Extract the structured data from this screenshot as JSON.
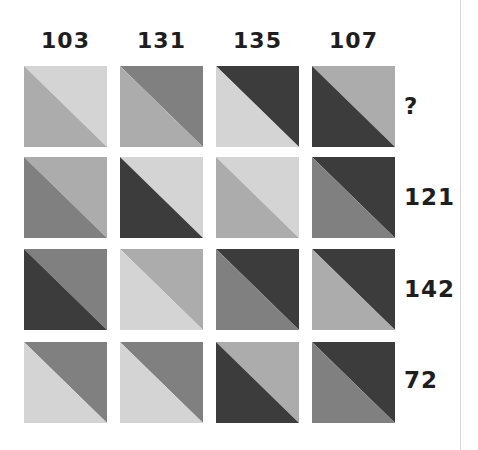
{
  "puzzle": {
    "palette": {
      "L": "#d4d4d4",
      "ML": "#acacac",
      "MD": "#808080",
      "D": "#3c3c3c"
    },
    "column_totals": [
      "103",
      "131",
      "135",
      "107"
    ],
    "row_totals": [
      "?",
      "121",
      "142",
      "72"
    ],
    "grid": [
      [
        {
          "top_right": "#d4d4d4",
          "bottom_left": "#acacac"
        },
        {
          "top_right": "#808080",
          "bottom_left": "#acacac"
        },
        {
          "top_right": "#3c3c3c",
          "bottom_left": "#d4d4d4"
        },
        {
          "top_right": "#acacac",
          "bottom_left": "#3c3c3c"
        }
      ],
      [
        {
          "top_right": "#acacac",
          "bottom_left": "#808080"
        },
        {
          "top_right": "#d4d4d4",
          "bottom_left": "#3c3c3c"
        },
        {
          "top_right": "#d4d4d4",
          "bottom_left": "#acacac"
        },
        {
          "top_right": "#3c3c3c",
          "bottom_left": "#808080"
        }
      ],
      [
        {
          "top_right": "#808080",
          "bottom_left": "#3c3c3c"
        },
        {
          "top_right": "#acacac",
          "bottom_left": "#d4d4d4"
        },
        {
          "top_right": "#3c3c3c",
          "bottom_left": "#808080"
        },
        {
          "top_right": "#3c3c3c",
          "bottom_left": "#acacac"
        }
      ],
      [
        {
          "top_right": "#808080",
          "bottom_left": "#d4d4d4"
        },
        {
          "top_right": "#808080",
          "bottom_left": "#d4d4d4"
        },
        {
          "top_right": "#acacac",
          "bottom_left": "#3c3c3c"
        },
        {
          "top_right": "#3c3c3c",
          "bottom_left": "#808080"
        }
      ]
    ]
  }
}
